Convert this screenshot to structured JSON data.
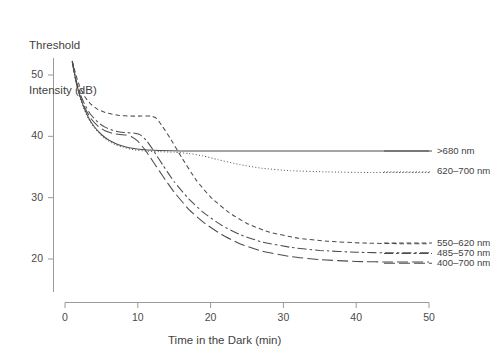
{
  "chart_data": {
    "type": "line",
    "title": "",
    "xlabel": "Time in the Dark (min)",
    "ylabel": "Threshold Intensity (dB)",
    "xlim": [
      0,
      50
    ],
    "ylim": [
      17,
      54
    ],
    "xticks": [
      0,
      10,
      20,
      30,
      40,
      50
    ],
    "yticks": [
      20,
      30,
      40,
      50
    ],
    "grid": false,
    "legend_position": "right-inline",
    "series": [
      {
        "name": ">680 nm",
        "style": "solid",
        "label_x": 49,
        "label_y": 37.6,
        "x": [
          1.0,
          1.4,
          1.9,
          2.5,
          3.2,
          4.0,
          5.0,
          6.0,
          7.0,
          8.0,
          9.5,
          11.0,
          13.0,
          16.0,
          20.0,
          26.0,
          33.0,
          40.0,
          47.0,
          50.0
        ],
        "y": [
          52.2,
          49.6,
          47.2,
          45.0,
          43.1,
          41.6,
          40.3,
          39.4,
          38.8,
          38.4,
          38.0,
          37.8,
          37.7,
          37.6,
          37.6,
          37.6,
          37.6,
          37.6,
          37.6,
          37.6
        ]
      },
      {
        "name": "620–700 nm",
        "style": "dotted",
        "label_x": 49,
        "label_y": 34.2,
        "x": [
          1.0,
          1.4,
          1.9,
          2.5,
          3.2,
          4.0,
          5.0,
          6.0,
          7.0,
          8.0,
          9.5,
          11.0,
          13.0,
          15.0,
          17.0,
          19.0,
          21.0,
          24.0,
          27.0,
          31.0,
          36.0,
          42.0,
          50.0
        ],
        "y": [
          52.2,
          49.5,
          47.0,
          44.8,
          42.9,
          41.4,
          40.1,
          39.2,
          38.6,
          38.2,
          37.8,
          37.6,
          37.5,
          37.4,
          37.2,
          36.8,
          36.2,
          35.4,
          34.8,
          34.4,
          34.2,
          34.1,
          34.1
        ]
      },
      {
        "name": "550–620 nm",
        "style": "dashed-short",
        "label_x": 49,
        "label_y": 22.6,
        "x": [
          1.0,
          1.5,
          2.0,
          2.7,
          3.5,
          4.5,
          5.5,
          6.5,
          7.5,
          9.0,
          10.5,
          11.8,
          12.6,
          13.4,
          14.5,
          16.0,
          18.0,
          20.0,
          22.5,
          25.0,
          28.0,
          32.0,
          36.0,
          41.0,
          46.0,
          50.0
        ],
        "y": [
          52.3,
          50.0,
          48.2,
          46.5,
          45.3,
          44.4,
          43.9,
          43.6,
          43.4,
          43.3,
          43.3,
          43.3,
          42.9,
          41.6,
          39.6,
          36.6,
          32.9,
          30.1,
          27.6,
          25.8,
          24.4,
          23.4,
          22.9,
          22.6,
          22.5,
          22.5
        ]
      },
      {
        "name": "485–570 nm",
        "style": "dash-dot",
        "label_x": 49,
        "label_y": 20.9,
        "x": [
          1.0,
          1.5,
          2.0,
          2.7,
          3.5,
          4.5,
          5.5,
          6.5,
          7.5,
          8.5,
          9.6,
          10.4,
          11.2,
          12.2,
          13.5,
          15.0,
          17.0,
          19.0,
          21.5,
          24.0,
          27.0,
          31.0,
          35.0,
          40.0,
          45.0,
          50.0
        ],
        "y": [
          52.2,
          49.3,
          47.2,
          45.2,
          43.6,
          42.3,
          41.5,
          41.0,
          40.7,
          40.6,
          40.5,
          40.2,
          39.3,
          37.6,
          35.2,
          32.6,
          29.8,
          27.6,
          25.5,
          24.0,
          22.8,
          21.9,
          21.4,
          21.1,
          21.0,
          21.0
        ]
      },
      {
        "name": "400–700 nm",
        "style": "dashed-long",
        "label_x": 49,
        "label_y": 19.3,
        "x": [
          1.0,
          1.5,
          2.0,
          2.7,
          3.5,
          4.5,
          5.5,
          6.5,
          7.5,
          8.4,
          9.2,
          10.0,
          11.0,
          12.2,
          13.5,
          15.0,
          17.0,
          19.0,
          21.5,
          24.0,
          27.0,
          31.0,
          35.0,
          40.0,
          45.0,
          50.0
        ],
        "y": [
          52.1,
          49.0,
          46.8,
          44.7,
          43.0,
          41.7,
          40.9,
          40.5,
          40.3,
          40.2,
          39.9,
          39.2,
          37.8,
          35.7,
          33.4,
          30.9,
          28.1,
          26.0,
          24.0,
          22.5,
          21.3,
          20.4,
          19.9,
          19.6,
          19.5,
          19.5
        ]
      }
    ]
  },
  "axes": {
    "x_tick_labels": [
      "0",
      "10",
      "20",
      "30",
      "40",
      "50"
    ],
    "y_tick_labels": [
      "20",
      "30",
      "40",
      "50"
    ],
    "y_axis_title_line1": "Threshold",
    "y_axis_title_line2": "Intensity (dB)",
    "x_axis_title": "Time in the Dark (min)"
  },
  "colors": {
    "line": "#4d4d4d",
    "axis": "#9a9a9a",
    "text": "#3f3f3f",
    "background": "#ffffff"
  }
}
